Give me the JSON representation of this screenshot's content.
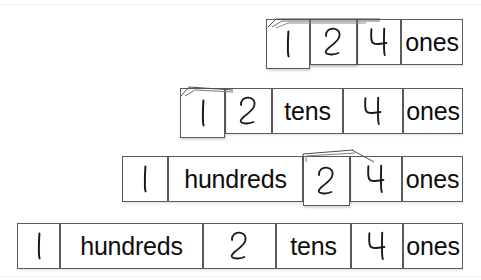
{
  "page": {
    "background_color": "#ffffff",
    "border_color": "#5b5b5b",
    "text_color": "#0d0d0d",
    "width": 481,
    "height": 280
  },
  "labels": {
    "ones": "ones",
    "tens": "tens",
    "hundreds": "hundreds",
    "one": "1",
    "two": "2",
    "four": "4"
  },
  "rows": [
    {
      "name": "row-folded-to-ones",
      "description": "Cards folded so only 1, 2, 4 and ones are visible",
      "number_shown": "124",
      "cells": [
        {
          "name": "cell-hundreds-digit",
          "kind": "digit",
          "value": "1",
          "folded": true
        },
        {
          "name": "cell-tens-digit",
          "kind": "digit",
          "value": "2",
          "folded": true
        },
        {
          "name": "cell-ones-digit",
          "kind": "digit",
          "value": "4",
          "folded": false
        },
        {
          "name": "cell-ones-word",
          "kind": "word",
          "value": "ones",
          "folded": false
        }
      ]
    },
    {
      "name": "row-tens-revealed",
      "description": "Hundreds card still folded; tens label revealed",
      "number_shown": "124",
      "cells": [
        {
          "name": "cell-hundreds-digit",
          "kind": "digit",
          "value": "1",
          "folded": true
        },
        {
          "name": "cell-tens-digit",
          "kind": "digit",
          "value": "2",
          "folded": false
        },
        {
          "name": "cell-tens-word",
          "kind": "word",
          "value": "tens",
          "folded": false
        },
        {
          "name": "cell-ones-digit",
          "kind": "digit",
          "value": "4",
          "folded": false
        },
        {
          "name": "cell-ones-word",
          "kind": "word",
          "value": "ones",
          "folded": false
        }
      ]
    },
    {
      "name": "row-hundreds-revealed",
      "description": "Hundreds label revealed; tens card still folded",
      "number_shown": "124",
      "cells": [
        {
          "name": "cell-hundreds-digit",
          "kind": "digit",
          "value": "1",
          "folded": false
        },
        {
          "name": "cell-hundreds-word",
          "kind": "word",
          "value": "hundreds",
          "folded": false
        },
        {
          "name": "cell-tens-digit",
          "kind": "digit",
          "value": "2",
          "folded": true
        },
        {
          "name": "cell-ones-digit",
          "kind": "digit",
          "value": "4",
          "folded": false
        },
        {
          "name": "cell-ones-word",
          "kind": "word",
          "value": "ones",
          "folded": false
        }
      ]
    },
    {
      "name": "row-fully-expanded",
      "description": "All cards unfolded showing 1 hundreds 2 tens 4 ones",
      "number_shown": "124",
      "cells": [
        {
          "name": "cell-hundreds-digit",
          "kind": "digit",
          "value": "1",
          "folded": false
        },
        {
          "name": "cell-hundreds-word",
          "kind": "word",
          "value": "hundreds",
          "folded": false
        },
        {
          "name": "cell-tens-digit",
          "kind": "digit",
          "value": "2",
          "folded": false
        },
        {
          "name": "cell-tens-word",
          "kind": "word",
          "value": "tens",
          "folded": false
        },
        {
          "name": "cell-ones-digit",
          "kind": "digit",
          "value": "4",
          "folded": false
        },
        {
          "name": "cell-ones-word",
          "kind": "word",
          "value": "ones",
          "folded": false
        }
      ]
    }
  ]
}
